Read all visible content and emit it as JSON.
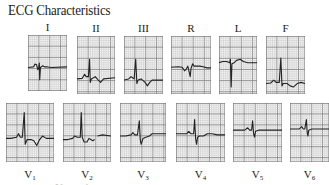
{
  "title": "ECG Characteristics",
  "colors": {
    "grid_minor": "#c9c9c9",
    "grid_major": "#8a8a8a",
    "trace": "#222222",
    "text": "#1a1a1a"
  },
  "limb_leads": [
    {
      "label": "I",
      "box": [
        28,
        35,
        39,
        56
      ],
      "baseline": 0.58,
      "trace": "M0,58 L14,57 L18,52 L22,53 L25,62 L27,60 L29,50 L30,80 L32,58 L38,55 L42,57 L50,57 L60,58 L100,57"
    },
    {
      "label": "II",
      "box": [
        77,
        36,
        38,
        58
      ],
      "baseline": 0.74,
      "trace": "M0,74 L14,73 L20,66 L24,70 L30,70 L33,40 L35,80 L38,74 L48,70 L56,76 L62,80 L70,74 L100,72"
    },
    {
      "label": "III",
      "box": [
        124,
        36,
        39,
        58
      ],
      "baseline": 0.74,
      "trace": "M0,76 L12,74 L18,70 L22,72 L26,74 L30,40 L33,82 L36,76 L44,74 L54,80 L60,86 L66,80 L72,76 L100,76"
    },
    {
      "label": "R",
      "box": [
        171,
        36,
        40,
        58
      ],
      "baseline": 0.55,
      "trace": "M0,54 L18,53 L28,54 L34,60 L38,57 L42,52 L46,64 L48,70 L50,56 L54,48 L58,52 L64,52 L72,52 L80,53 L90,55 L100,55"
    },
    {
      "label": "L",
      "box": [
        219,
        36,
        38,
        58
      ],
      "baseline": 0.45,
      "trace": "M0,46 L10,44 L20,44 L28,46 L30,40 L32,88 L34,48 L40,46 L46,42 L56,40 L64,44 L76,46 L90,46 L100,46"
    },
    {
      "label": "F",
      "box": [
        266,
        36,
        39,
        58
      ],
      "baseline": 0.8,
      "trace": "M0,82 L12,81 L20,76 L26,80 L34,80 L38,38 L41,86 L44,82 L54,82 L62,86 L70,88 L80,82 L90,80 L100,82"
    }
  ],
  "chest_leads": [
    {
      "label": "V",
      "sub": "1",
      "box": [
        6,
        103,
        48,
        59
      ],
      "trace": "M0,60 L10,60 L22,58 L26,52 L30,58 L34,58 L38,16 L40,70 L44,62 L52,62 L58,64 L64,72 L70,62 L76,56 L84,60 L100,60"
    },
    {
      "label": "V",
      "sub": "2",
      "box": [
        63,
        103,
        48,
        59
      ],
      "trace": "M0,62 L10,62 L20,60 L24,56 L30,58 L36,58 L38,16 L40,58 L44,66 L50,66 L54,60 L58,62 L62,64 L66,62 M72,56 L82,54 L100,56"
    },
    {
      "label": "V",
      "sub": "3",
      "box": [
        120,
        103,
        46,
        59
      ],
      "trace": "M0,56 L12,56 L24,54 L28,50 L32,54 L38,54 L42,30 L44,62 L46,70 L50,60 L56,58 L64,56 L70,52 L80,52 L90,52 L100,52"
    },
    {
      "label": "V",
      "sub": "4",
      "box": [
        176,
        103,
        49,
        59
      ],
      "trace": "M0,52 L10,52 L22,52 L26,48 L30,52 L36,52 L38,28 L40,60 L42,70 L44,58 L48,56 L56,56 L64,52 L74,52 L84,54 L100,54"
    },
    {
      "label": "V",
      "sub": "5",
      "box": [
        233,
        103,
        49,
        59
      ],
      "trace": "M0,46 L10,46 L24,46 L30,42 L34,46 L38,46 L40,30 L42,52 L44,58 L46,48 L52,46 L64,46 L76,46 L100,46"
    },
    {
      "label": "V",
      "sub": "6",
      "box": [
        290,
        103,
        39,
        59
      ],
      "trace": "M0,44 L10,44 L24,44 L30,40 L34,44 L38,44 L42,28 L44,50 L46,56 L48,46 L56,44 L70,44 L86,44 L100,44"
    }
  ],
  "footer_fragment": "Normal"
}
